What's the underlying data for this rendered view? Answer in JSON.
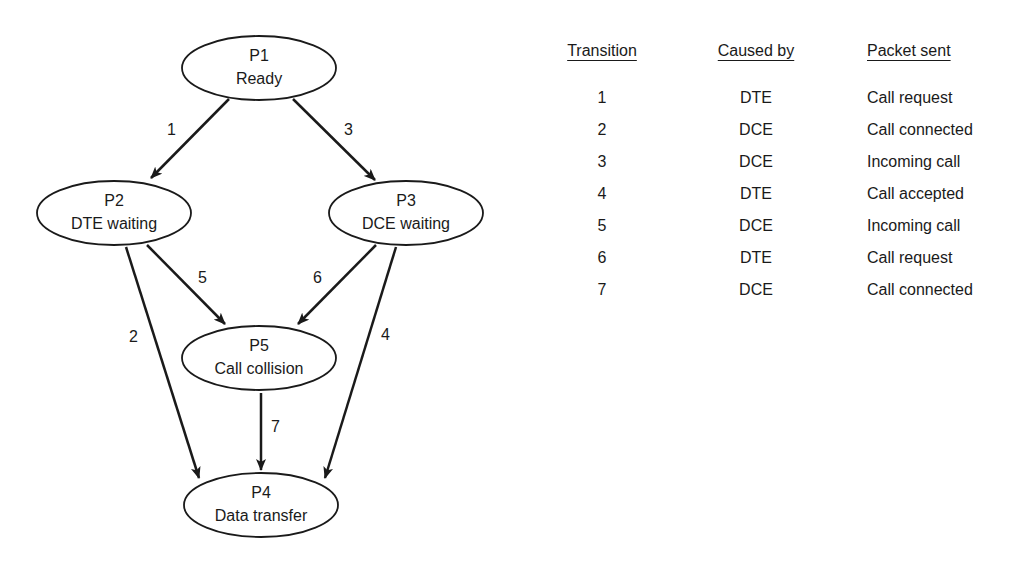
{
  "diagram": {
    "nodes": [
      {
        "id": "P1",
        "name": "P1",
        "label": "Ready"
      },
      {
        "id": "P2",
        "name": "P2",
        "label": "DTE waiting"
      },
      {
        "id": "P3",
        "name": "P3",
        "label": "DCE waiting"
      },
      {
        "id": "P5",
        "name": "P5",
        "label": "Call collision"
      },
      {
        "id": "P4",
        "name": "P4",
        "label": "Data transfer"
      }
    ],
    "edges": [
      {
        "from": "P1",
        "to": "P2",
        "label": "1"
      },
      {
        "from": "P2",
        "to": "P4",
        "label": "2"
      },
      {
        "from": "P1",
        "to": "P3",
        "label": "3"
      },
      {
        "from": "P3",
        "to": "P4",
        "label": "4"
      },
      {
        "from": "P2",
        "to": "P5",
        "label": "5"
      },
      {
        "from": "P3",
        "to": "P5",
        "label": "6"
      },
      {
        "from": "P5",
        "to": "P4",
        "label": "7"
      }
    ]
  },
  "table": {
    "headers": [
      "Transition",
      "Caused by",
      "Packet sent"
    ],
    "rows": [
      [
        "1",
        "DTE",
        "Call request"
      ],
      [
        "2",
        "DCE",
        "Call connected"
      ],
      [
        "3",
        "DCE",
        "Incoming call"
      ],
      [
        "4",
        "DTE",
        "Call accepted"
      ],
      [
        "5",
        "DCE",
        "Incoming call"
      ],
      [
        "6",
        "DTE",
        "Call request"
      ],
      [
        "7",
        "DCE",
        "Call connected"
      ]
    ]
  }
}
